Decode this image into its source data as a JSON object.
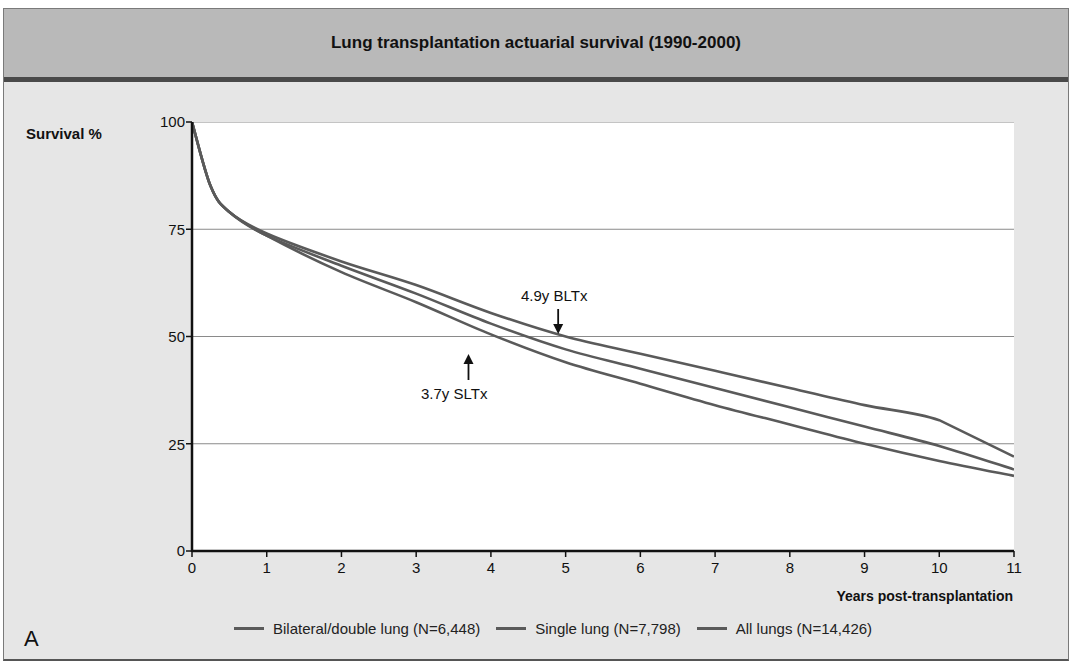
{
  "figure": {
    "title": "Lung transplantation actuarial survival (1990-2000)",
    "panel_label": "A",
    "y_axis_label": "Survival %",
    "x_axis_label": "Years post-transplantation",
    "y_ticks": [
      "100",
      "75",
      "50",
      "25",
      "0"
    ],
    "x_ticks": [
      "0",
      "1",
      "2",
      "3",
      "4",
      "5",
      "6",
      "7",
      "8",
      "9",
      "10",
      "11"
    ],
    "annotations": [
      {
        "text": "4.9y BLTx",
        "x": 4.9,
        "y": 50,
        "arrow": "down"
      },
      {
        "text": "3.7y SLTx",
        "x": 3.7,
        "y": 50,
        "arrow": "up"
      }
    ],
    "legend": [
      {
        "label": "Bilateral/double lung (N=6,448)"
      },
      {
        "label": "Single lung (N=7,798)"
      },
      {
        "label": "All lungs (N=14,426)"
      }
    ]
  },
  "chart_data": {
    "type": "line",
    "title": "Lung transplantation actuarial survival (1990-2000)",
    "xlabel": "Years post-transplantation",
    "ylabel": "Survival %",
    "xlim": [
      0,
      11
    ],
    "ylim": [
      0,
      100
    ],
    "grid": "horizontal at 25, 50, 75, 100",
    "legend_position": "bottom",
    "x": [
      0,
      0.25,
      0.5,
      1,
      2,
      3,
      4,
      5,
      6,
      7,
      8,
      9,
      10,
      11
    ],
    "series": [
      {
        "name": "Bilateral/double lung (N=6,448)",
        "values": [
          100,
          85,
          79,
          74,
          67.5,
          62,
          55.5,
          50,
          46,
          42,
          38,
          34,
          30.5,
          22
        ]
      },
      {
        "name": "Single lung (N=7,798)",
        "values": [
          100,
          85,
          79,
          73.5,
          65,
          58,
          50.5,
          44,
          39,
          34,
          29.5,
          25,
          21,
          17.5
        ]
      },
      {
        "name": "All lungs (N=14,426)",
        "values": [
          100,
          85,
          79,
          73.5,
          66.5,
          60,
          53,
          47,
          42.5,
          38,
          33.5,
          29,
          24.5,
          19
        ]
      }
    ],
    "annotations": [
      {
        "text": "4.9y BLTx",
        "x": 4.9,
        "y": 50
      },
      {
        "text": "3.7y SLTx",
        "x": 3.7,
        "y": 50
      }
    ],
    "colors": {
      "lines": "#5a5a5a",
      "grid": "#8a8a8a",
      "header": "#b9b9b9",
      "background": "#e6e6e6"
    }
  }
}
